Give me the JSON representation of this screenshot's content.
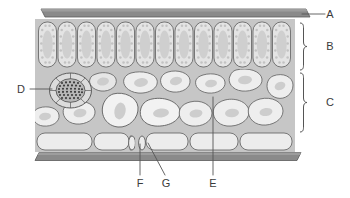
{
  "figure": {
    "type": "biological-cross-section-diagram",
    "background_color": "#ffffff",
    "stroke_color": "#555555"
  },
  "colors": {
    "cuticle": "#8a8a8a",
    "cuticle_dark": "#6e6e6e",
    "mesophyll_background": "#c6c6c6",
    "cell_fill": "#e2e2e2",
    "cell_fill_light": "#ececec",
    "nucleus": "#bdbdbd",
    "chloroplast": "#c9c9c9",
    "vascular_fill": "#9a9a9a",
    "label_text": "#3b3b3b",
    "leader_line": "#555555"
  },
  "labels": [
    {
      "id": "A",
      "text": "A",
      "target": "upper-cuticle",
      "x": 332,
      "y": 18,
      "leader": "horizontal-right"
    },
    {
      "id": "B",
      "text": "B",
      "target": "palisade-mesophyll-layer",
      "x": 332,
      "y": 47,
      "leader": "brace"
    },
    {
      "id": "C",
      "text": "C",
      "target": "spongy-mesophyll-layer",
      "x": 332,
      "y": 103,
      "leader": "brace"
    },
    {
      "id": "D",
      "text": "D",
      "target": "vascular-bundle",
      "x": 20,
      "y": 92,
      "leader": "horizontal-right"
    },
    {
      "id": "E",
      "text": "E",
      "target": "air-space",
      "x": 212,
      "y": 186,
      "leader": "vertical-up"
    },
    {
      "id": "F",
      "text": "F",
      "target": "guard-cell",
      "x": 139,
      "y": 186,
      "leader": "vertical-up"
    },
    {
      "id": "G",
      "text": "G",
      "target": "stoma",
      "x": 163,
      "y": 186,
      "leader": "diagonal-up-left"
    }
  ],
  "layers": [
    {
      "name": "upper-cuticle",
      "label_id": "A"
    },
    {
      "name": "palisade-mesophyll",
      "label_id": "B",
      "cell_count": 13
    },
    {
      "name": "spongy-mesophyll",
      "label_id": "C"
    },
    {
      "name": "vascular-bundle",
      "label_id": "D"
    },
    {
      "name": "lower-epidermis",
      "label_id": null
    },
    {
      "name": "lower-cuticle",
      "label_id": null
    },
    {
      "name": "guard-cell",
      "label_id": "F"
    },
    {
      "name": "stoma",
      "label_id": "G"
    },
    {
      "name": "air-space",
      "label_id": "E"
    }
  ]
}
